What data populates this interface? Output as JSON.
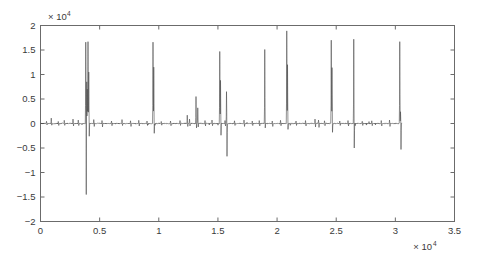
{
  "chart_data": {
    "type": "line",
    "title": "",
    "xlabel": "",
    "ylabel": "",
    "x_multiplier": "× 10",
    "x_multiplier_exp": "4",
    "y_multiplier": "× 10",
    "y_multiplier_exp": "4",
    "xlim": [
      0,
      35000
    ],
    "ylim": [
      -20000,
      20000
    ],
    "xticks": [
      0,
      5000,
      10000,
      15000,
      20000,
      25000,
      30000,
      35000
    ],
    "xtick_labels": [
      "0",
      "0.5",
      "1",
      "1.5",
      "2",
      "2.5",
      "3",
      "3.5"
    ],
    "yticks": [
      -20000,
      -15000,
      -10000,
      -5000,
      0,
      5000,
      10000,
      15000,
      20000
    ],
    "ytick_labels": [
      "−2",
      "−1.5",
      "−1",
      "−0.5",
      "0",
      "0.5",
      "1",
      "1.5",
      "2"
    ],
    "grid": false,
    "legend": null,
    "line_color": "#4a4a4a",
    "line_width": 0.6,
    "axis_color": "#6b6b6b",
    "background": "#ffffff",
    "data_x_start": 0,
    "data_x_end": 30550,
    "n_samples": 30550,
    "baseline_noise_amplitude": 350,
    "series_name": "signal",
    "spikes": [
      {
        "x": 500,
        "pos": 450,
        "neg": -300
      },
      {
        "x": 900,
        "pos": 1100,
        "neg": -350
      },
      {
        "x": 1500,
        "pos": 420,
        "neg": -400
      },
      {
        "x": 2000,
        "pos": 650,
        "neg": -380
      },
      {
        "x": 2750,
        "pos": 900,
        "neg": -500
      },
      {
        "x": 3200,
        "pos": 700,
        "neg": -420
      },
      {
        "x": 3820,
        "pos": 16600,
        "neg": -14500
      },
      {
        "x": 3900,
        "pos": 8500,
        "neg": -18100
      },
      {
        "x": 3960,
        "pos": 7000,
        "neg": -3000
      },
      {
        "x": 4020,
        "pos": 16700,
        "neg": -15500
      },
      {
        "x": 4080,
        "pos": 10500,
        "neg": -2600
      },
      {
        "x": 4500,
        "pos": 800,
        "neg": -600
      },
      {
        "x": 5200,
        "pos": 600,
        "neg": -700
      },
      {
        "x": 6000,
        "pos": 500,
        "neg": -450
      },
      {
        "x": 6900,
        "pos": 800,
        "neg": -420
      },
      {
        "x": 7600,
        "pos": 550,
        "neg": -600
      },
      {
        "x": 8300,
        "pos": 650,
        "neg": -500
      },
      {
        "x": 9000,
        "pos": 500,
        "neg": -400
      },
      {
        "x": 9520,
        "pos": 16600,
        "neg": -16400
      },
      {
        "x": 9580,
        "pos": 11500,
        "neg": -2000
      },
      {
        "x": 10200,
        "pos": 420,
        "neg": -350
      },
      {
        "x": 11000,
        "pos": 500,
        "neg": -450
      },
      {
        "x": 11800,
        "pos": 600,
        "neg": -400
      },
      {
        "x": 12400,
        "pos": 1700,
        "neg": -600
      },
      {
        "x": 12600,
        "pos": 900,
        "neg": -500
      },
      {
        "x": 13150,
        "pos": 5500,
        "neg": -900
      },
      {
        "x": 13300,
        "pos": 3200,
        "neg": -700
      },
      {
        "x": 13900,
        "pos": 600,
        "neg": -500
      },
      {
        "x": 14500,
        "pos": 700,
        "neg": -450
      },
      {
        "x": 15150,
        "pos": 14700,
        "neg": -15900
      },
      {
        "x": 15220,
        "pos": 8800,
        "neg": -2400
      },
      {
        "x": 15600,
        "pos": 600,
        "neg": -500
      },
      {
        "x": 15720,
        "pos": 6500,
        "neg": -6700
      },
      {
        "x": 16400,
        "pos": 550,
        "neg": -400
      },
      {
        "x": 17200,
        "pos": 700,
        "neg": -600
      },
      {
        "x": 17900,
        "pos": 500,
        "neg": -420
      },
      {
        "x": 18500,
        "pos": 600,
        "neg": -500
      },
      {
        "x": 18950,
        "pos": 15100,
        "neg": -900
      },
      {
        "x": 19600,
        "pos": 500,
        "neg": -600
      },
      {
        "x": 20300,
        "pos": 650,
        "neg": -450
      },
      {
        "x": 20820,
        "pos": 18900,
        "neg": -1500
      },
      {
        "x": 20880,
        "pos": 12000,
        "neg": -1200
      },
      {
        "x": 21600,
        "pos": 500,
        "neg": -400
      },
      {
        "x": 22400,
        "pos": 600,
        "neg": -500
      },
      {
        "x": 23200,
        "pos": 900,
        "neg": -700
      },
      {
        "x": 23500,
        "pos": 700,
        "neg": -800
      },
      {
        "x": 24000,
        "pos": 550,
        "neg": -450
      },
      {
        "x": 24580,
        "pos": 17000,
        "neg": -15500
      },
      {
        "x": 24650,
        "pos": 11400,
        "neg": -1800
      },
      {
        "x": 25300,
        "pos": 500,
        "neg": -400
      },
      {
        "x": 26000,
        "pos": 600,
        "neg": -500
      },
      {
        "x": 26480,
        "pos": 17200,
        "neg": -5000
      },
      {
        "x": 27200,
        "pos": 450,
        "neg": -400
      },
      {
        "x": 28000,
        "pos": 550,
        "neg": -450
      },
      {
        "x": 28800,
        "pos": 600,
        "neg": -500
      },
      {
        "x": 29500,
        "pos": 700,
        "neg": -600
      },
      {
        "x": 30380,
        "pos": 16700,
        "neg": -15200
      },
      {
        "x": 30440,
        "pos": 2400,
        "neg": -5300
      }
    ]
  }
}
